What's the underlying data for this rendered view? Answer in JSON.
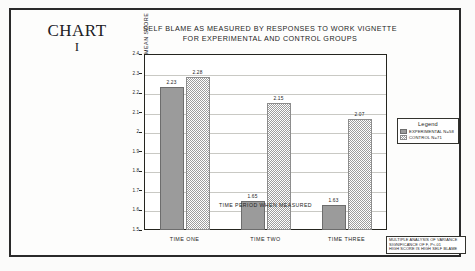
{
  "chart_number": {
    "word": "CHART",
    "numeral": "I"
  },
  "chart_data": {
    "type": "bar",
    "title": "SELF BLAME AS MEASURED BY RESPONSES TO WORK VIGNETTE FOR EXPERIMENTAL AND CONTROL GROUPS",
    "title_line1": "SELF BLAME AS MEASURED BY RESPONSES TO WORK VIGNETTE",
    "title_line2": "FOR EXPERIMENTAL AND CONTROL GROUPS",
    "categories": [
      "TIME ONE",
      "TIME TWO",
      "TIME THREE"
    ],
    "series": [
      {
        "name": "EXPERIMENTAL N=58",
        "values": [
          2.23,
          1.65,
          1.63
        ]
      },
      {
        "name": "CONTROL N=71",
        "values": [
          2.28,
          2.15,
          2.07
        ]
      }
    ],
    "xlabel": "TIME PERIOD WHEN MEASURED",
    "ylabel": "MEAN SCORE",
    "ylim": [
      1.5,
      2.4
    ],
    "ytick_labels": [
      "2.4",
      "2.3",
      "2.2",
      "2.1",
      "2",
      "1.9",
      "1.8",
      "1.7",
      "1.6",
      "1.5"
    ],
    "grid": true,
    "legend_position": "right"
  },
  "legend": {
    "title": "Legend",
    "entries": [
      {
        "label": "EXPERIMENTAL N=58",
        "swatch": "solid-gray"
      },
      {
        "label": "CONTROL N=71",
        "swatch": "checkered-gray"
      }
    ]
  },
  "footnote": {
    "line1": "MULTIPLE ANALYSIS OF VARIANCE",
    "line2": "SIGNIFICANCE OF F, P<.01",
    "line3": "HIGH SCORE IS HIGH SELF BLAME"
  }
}
